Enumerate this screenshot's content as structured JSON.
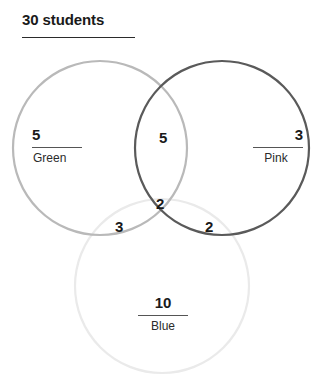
{
  "header": {
    "title": "30 students",
    "rule_color": "#2b2b2b"
  },
  "diagram": {
    "type": "venn-3-set",
    "sets": [
      {
        "id": "green",
        "name": "Green",
        "only_count": "5",
        "stroke_color": "#b9b9b9",
        "center": [
          100,
          148
        ],
        "radius": 87
      },
      {
        "id": "pink",
        "name": "Pink",
        "only_count": "3",
        "stroke_color": "#5a5a5a",
        "center": [
          222,
          148
        ],
        "radius": 87
      },
      {
        "id": "blue",
        "name": "Blue",
        "only_count": "10",
        "stroke_color": "#eaeaea",
        "center": [
          162,
          286
        ],
        "radius": 87
      }
    ],
    "intersections": [
      {
        "id": "green-pink",
        "label": "Green ∩ Pink",
        "count": "5"
      },
      {
        "id": "green-blue",
        "label": "Green ∩ Blue",
        "count": "3"
      },
      {
        "id": "pink-blue",
        "label": "Pink ∩ Blue",
        "count": "2"
      },
      {
        "id": "green-pink-blue",
        "label": "Green ∩ Pink ∩ Blue",
        "count": "2"
      }
    ]
  },
  "chart_data": {
    "type": "venn",
    "title": "30 students",
    "total": 30,
    "set_names": [
      "Green",
      "Pink",
      "Blue"
    ],
    "regions": [
      {
        "sets": [
          "Green"
        ],
        "value": 5
      },
      {
        "sets": [
          "Pink"
        ],
        "value": 3
      },
      {
        "sets": [
          "Blue"
        ],
        "value": 10
      },
      {
        "sets": [
          "Green",
          "Pink"
        ],
        "value": 5
      },
      {
        "sets": [
          "Green",
          "Blue"
        ],
        "value": 3
      },
      {
        "sets": [
          "Pink",
          "Blue"
        ],
        "value": 2
      },
      {
        "sets": [
          "Green",
          "Pink",
          "Blue"
        ],
        "value": 2
      }
    ],
    "set_totals": {
      "Green": 15,
      "Pink": 12,
      "Blue": 17
    },
    "colors": {
      "Green": "#b9b9b9",
      "Pink": "#5a5a5a",
      "Blue": "#eaeaea"
    },
    "grid": false,
    "legend": "none",
    "xlabel": "",
    "ylabel": ""
  }
}
